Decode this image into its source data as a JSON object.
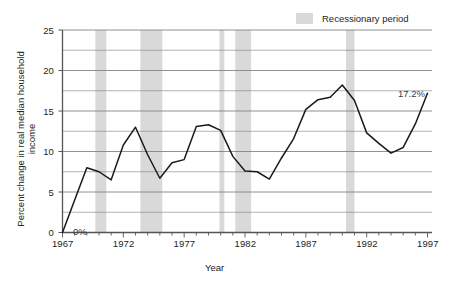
{
  "chart_data": {
    "type": "line",
    "title": "",
    "xlabel": "Year",
    "ylabel": "Percent change in real median household income",
    "xlim": [
      1967,
      1997
    ],
    "ylim": [
      0,
      25
    ],
    "grid": true,
    "gridlines_y": [
      0,
      2.5,
      5,
      7.5,
      10,
      12.5,
      15,
      17.5,
      20,
      22.5,
      25
    ],
    "ytick_labels": [
      "0",
      "5",
      "10",
      "15",
      "20",
      "25"
    ],
    "ytick_values": [
      0,
      5,
      10,
      15,
      20,
      25
    ],
    "xtick_labels": [
      "1967",
      "1972",
      "1977",
      "1982",
      "1987",
      "1992",
      "1997"
    ],
    "xtick_values": [
      1967,
      1972,
      1977,
      1982,
      1987,
      1992,
      1997
    ],
    "xtick_minor_step": 1,
    "legend_position": "top-right",
    "legend": [
      {
        "label": "Recessionary period",
        "color": "#d9d9d9",
        "type": "band"
      }
    ],
    "series": [
      {
        "name": "Percent change in real median household income",
        "color": "#1a1a1a",
        "x": [
          1967,
          1968,
          1969,
          1970,
          1971,
          1972,
          1973,
          1974,
          1975,
          1976,
          1977,
          1978,
          1979,
          1980,
          1981,
          1982,
          1983,
          1984,
          1985,
          1986,
          1987,
          1988,
          1989,
          1990,
          1991,
          1992,
          1993,
          1994,
          1995,
          1996,
          1997
        ],
        "values": [
          0.0,
          4.0,
          8.0,
          7.5,
          6.5,
          10.8,
          13.0,
          9.6,
          6.7,
          8.6,
          9.0,
          13.1,
          13.3,
          12.6,
          9.4,
          7.6,
          7.5,
          6.6,
          9.2,
          11.6,
          15.2,
          16.4,
          16.7,
          18.2,
          16.3,
          12.3,
          11.0,
          9.8,
          10.5,
          13.4,
          17.2
        ]
      }
    ],
    "recession_bands": [
      {
        "start": 1969.7,
        "end": 1970.6
      },
      {
        "start": 1973.4,
        "end": 1975.2
      },
      {
        "start": 1979.9,
        "end": 1980.3
      },
      {
        "start": 1981.2,
        "end": 1982.5
      },
      {
        "start": 1990.3,
        "end": 1991.0
      }
    ],
    "annotations": [
      {
        "name": "start-value",
        "text": "0%",
        "x": 1967,
        "y": 0
      },
      {
        "name": "end-value",
        "text": "17.2%",
        "x": 1997,
        "y": 17.2
      }
    ]
  },
  "axes": {
    "x_title": "Year",
    "y_title": "Percent change in real median household income"
  },
  "legend": {
    "recession_label": "Recessionary period"
  },
  "annotations": {
    "zero": "0%",
    "end": "17.2%"
  },
  "yticks": {
    "t0": "0",
    "t1": "5",
    "t2": "10",
    "t3": "15",
    "t4": "20",
    "t5": "25"
  },
  "xticks": {
    "t0": "1967",
    "t1": "1972",
    "t2": "1977",
    "t3": "1982",
    "t4": "1987",
    "t5": "1992",
    "t6": "1997"
  },
  "colors": {
    "line": "#1a1a1a",
    "grid": "#808080",
    "axis": "#555555",
    "band": "#d9d9d9",
    "text": "#242424"
  }
}
